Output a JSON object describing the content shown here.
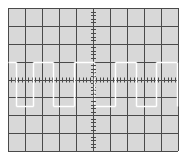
{
  "display": {
    "type": "oscilloscope-screen",
    "background_color": "#d8d8d8",
    "page_color": "#ffffff",
    "grid_color": "#4a4a4a",
    "trace_color": "#ffffff",
    "frame": {
      "x0": 8,
      "y0": 8,
      "x1": 178,
      "y1": 151
    },
    "divisions": {
      "horizontal": 10,
      "vertical": 8
    },
    "minor_ticks_per_division": 5
  },
  "chart_data": {
    "type": "line",
    "title": "",
    "xlabel": "",
    "ylabel": "",
    "grid": true,
    "series": [
      {
        "name": "square-wave",
        "points_px": [
          [
            8,
            62
          ],
          [
            16,
            62
          ],
          [
            16,
            106
          ],
          [
            33,
            106
          ],
          [
            33,
            62
          ],
          [
            53,
            62
          ],
          [
            53,
            106
          ],
          [
            74,
            106
          ],
          [
            74,
            62
          ],
          [
            94,
            62
          ],
          [
            94,
            106
          ],
          [
            115,
            106
          ],
          [
            115,
            62
          ],
          [
            136,
            62
          ],
          [
            136,
            106
          ],
          [
            156,
            106
          ],
          [
            156,
            62
          ],
          [
            177,
            62
          ],
          [
            177,
            106
          ]
        ],
        "high_level_px": 62,
        "low_level_px": 106,
        "period_px": 41
      }
    ]
  }
}
